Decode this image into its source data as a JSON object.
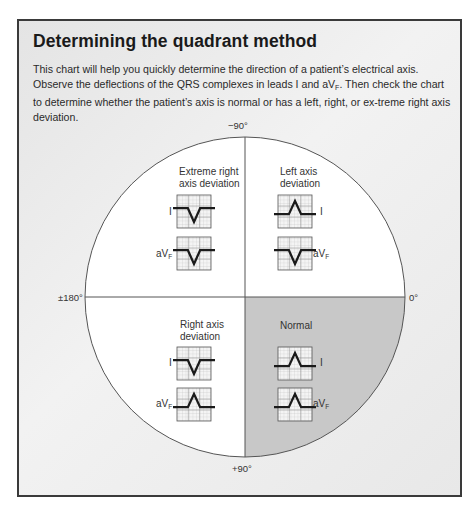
{
  "title": "Determining the quadrant method",
  "intro": {
    "part1": "This chart will help you quickly determine the direction of a patient’s electrical axis. Observe the deflections of the QRS complexes in leads I and aV",
    "sub": "F",
    "part2": ". Then check the chart to determine whether the patient’s axis is normal or has a left, right, or ex-treme right axis deviation."
  },
  "axes": {
    "top": "−90°",
    "bottom": "+90°",
    "left": "±180°",
    "right": "0°"
  },
  "colors": {
    "normal_quadrant": "#c8c8c8",
    "circle_fill": "#ffffff",
    "panel_border": "#3a3a3a",
    "waveform": "#1a1a1a"
  },
  "quadrants": [
    {
      "id": "extreme-right",
      "label_line1": "Extreme right",
      "label_line2": "axis deviation",
      "leads": [
        {
          "name": "I",
          "sub": "",
          "deflection": "negative"
        },
        {
          "name": "aV",
          "sub": "F",
          "deflection": "negative"
        }
      ]
    },
    {
      "id": "left-axis",
      "label_line1": "Left axis",
      "label_line2": "deviation",
      "leads": [
        {
          "name": "I",
          "sub": "",
          "deflection": "positive"
        },
        {
          "name": "aV",
          "sub": "F",
          "deflection": "negative"
        }
      ]
    },
    {
      "id": "right-axis",
      "label_line1": "Right axis",
      "label_line2": "deviation",
      "leads": [
        {
          "name": "I",
          "sub": "",
          "deflection": "negative"
        },
        {
          "name": "aV",
          "sub": "F",
          "deflection": "positive"
        }
      ]
    },
    {
      "id": "normal",
      "label_line1": "Normal",
      "label_line2": "",
      "leads": [
        {
          "name": "I",
          "sub": "",
          "deflection": "positive"
        },
        {
          "name": "aV",
          "sub": "F",
          "deflection": "positive"
        }
      ]
    }
  ]
}
